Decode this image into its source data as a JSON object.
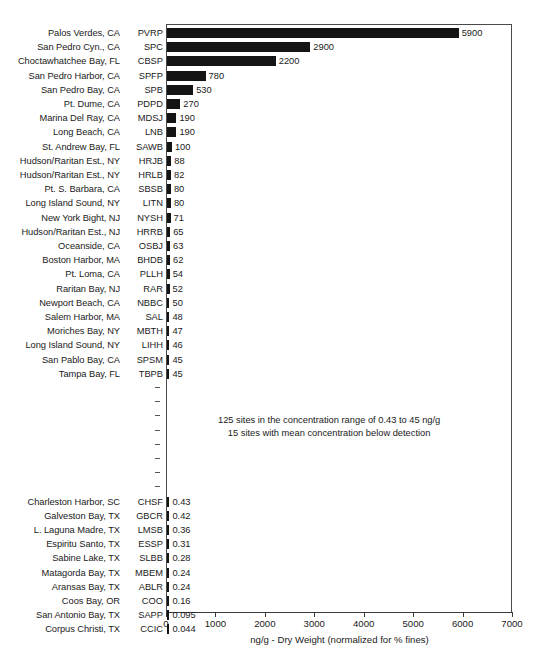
{
  "chart_data": {
    "type": "bar",
    "orientation": "horizontal",
    "title": "",
    "xlabel": "ng/g - Dry Weight (normalized for % fines)",
    "ylabel": "",
    "xlim": [
      0,
      7000
    ],
    "xticks": [
      0,
      1000,
      2000,
      3000,
      4000,
      5000,
      6000,
      7000
    ],
    "xtick_labels": [
      "0",
      "1000",
      "2000",
      "3000",
      "4000",
      "5000",
      "6000",
      "7000"
    ],
    "grid": false,
    "legend": null,
    "bar_color": "#141414",
    "axis_color": "#3a3a3a",
    "rows": [
      {
        "site": "Palos Verdes, CA",
        "code": "PVRP",
        "value": 5900,
        "label": "5900",
        "kind": "bar"
      },
      {
        "site": "San Pedro Cyn., CA",
        "code": "SPC",
        "value": 2900,
        "label": "2900",
        "kind": "bar"
      },
      {
        "site": "Choctawhatchee Bay, FL",
        "code": "CBSP",
        "value": 2200,
        "label": "2200",
        "kind": "bar"
      },
      {
        "site": "San Pedro Harbor, CA",
        "code": "SPFP",
        "value": 780,
        "label": "780",
        "kind": "bar"
      },
      {
        "site": "San Pedro Bay, CA",
        "code": "SPB",
        "value": 530,
        "label": "530",
        "kind": "bar"
      },
      {
        "site": "Pt. Dume, CA",
        "code": "PDPD",
        "value": 270,
        "label": "270",
        "kind": "bar"
      },
      {
        "site": "Marina Del Ray, CA",
        "code": "MDSJ",
        "value": 190,
        "label": "190",
        "kind": "bar"
      },
      {
        "site": "Long Beach, CA",
        "code": "LNB",
        "value": 190,
        "label": "190",
        "kind": "bar"
      },
      {
        "site": "St. Andrew Bay, FL",
        "code": "SAWB",
        "value": 100,
        "label": "100",
        "kind": "bar"
      },
      {
        "site": "Hudson/Raritan Est., NY",
        "code": "HRJB",
        "value": 88,
        "label": "88",
        "kind": "bar"
      },
      {
        "site": "Hudson/Raritan Est., NY",
        "code": "HRLB",
        "value": 82,
        "label": "82",
        "kind": "bar"
      },
      {
        "site": "Pt. S. Barbara, CA",
        "code": "SBSB",
        "value": 80,
        "label": "80",
        "kind": "bar"
      },
      {
        "site": "Long Island Sound, NY",
        "code": "LITN",
        "value": 80,
        "label": "80",
        "kind": "bar"
      },
      {
        "site": "New York Bight, NJ",
        "code": "NYSH",
        "value": 71,
        "label": "71",
        "kind": "bar"
      },
      {
        "site": "Hudson/Raritan Est., NJ",
        "code": "HRRB",
        "value": 65,
        "label": "65",
        "kind": "bar"
      },
      {
        "site": "Oceanside, CA",
        "code": "OSBJ",
        "value": 63,
        "label": "63",
        "kind": "bar"
      },
      {
        "site": "Boston Harbor, MA",
        "code": "BHDB",
        "value": 62,
        "label": "62",
        "kind": "bar"
      },
      {
        "site": "Pt. Loma, CA",
        "code": "PLLH",
        "value": 54,
        "label": "54",
        "kind": "bar"
      },
      {
        "site": "Raritan Bay, NJ",
        "code": "RAR",
        "value": 52,
        "label": "52",
        "kind": "bar"
      },
      {
        "site": "Newport Beach, CA",
        "code": "NBBC",
        "value": 50,
        "label": "50",
        "kind": "bar"
      },
      {
        "site": "Salem Harbor, MA",
        "code": "SAL",
        "value": 48,
        "label": "48",
        "kind": "bar"
      },
      {
        "site": "Moriches Bay, NY",
        "code": "MBTH",
        "value": 47,
        "label": "47",
        "kind": "bar"
      },
      {
        "site": "Long Island Sound, NY",
        "code": "LIHH",
        "value": 46,
        "label": "46",
        "kind": "bar"
      },
      {
        "site": "San Pablo Bay, CA",
        "code": "SPSM",
        "value": 45,
        "label": "45",
        "kind": "bar"
      },
      {
        "site": "Tampa Bay, FL",
        "code": "TBPB",
        "value": 45,
        "label": "45",
        "kind": "bar"
      },
      {
        "site": "",
        "code": "",
        "value": null,
        "label": "",
        "kind": "dash"
      },
      {
        "site": "",
        "code": "",
        "value": null,
        "label": "",
        "kind": "dash"
      },
      {
        "site": "",
        "code": "",
        "value": null,
        "label": "",
        "kind": "dash"
      },
      {
        "site": "",
        "code": "",
        "value": null,
        "label": "",
        "kind": "dash"
      },
      {
        "site": "",
        "code": "",
        "value": null,
        "label": "",
        "kind": "dash"
      },
      {
        "site": "",
        "code": "",
        "value": null,
        "label": "",
        "kind": "dash"
      },
      {
        "site": "",
        "code": "",
        "value": null,
        "label": "",
        "kind": "dash"
      },
      {
        "site": "",
        "code": "",
        "value": null,
        "label": "",
        "kind": "dash"
      },
      {
        "site": "Charleston Harbor, SC",
        "code": "CHSF",
        "value": 0.43,
        "label": "0.43",
        "kind": "bar"
      },
      {
        "site": "Galveston Bay, TX",
        "code": "GBCR",
        "value": 0.42,
        "label": "0.42",
        "kind": "bar"
      },
      {
        "site": "L. Laguna Madre, TX",
        "code": "LMSB",
        "value": 0.36,
        "label": "0.36",
        "kind": "bar"
      },
      {
        "site": "Espiritu Santo, TX",
        "code": "ESSP",
        "value": 0.31,
        "label": "0.31",
        "kind": "bar"
      },
      {
        "site": "Sabine Lake, TX",
        "code": "SLBB",
        "value": 0.28,
        "label": "0.28",
        "kind": "bar"
      },
      {
        "site": "Matagorda Bay, TX",
        "code": "MBEM",
        "value": 0.24,
        "label": "0.24",
        "kind": "bar"
      },
      {
        "site": "Aransas Bay, TX",
        "code": "ABLR",
        "value": 0.24,
        "label": "0.24",
        "kind": "bar"
      },
      {
        "site": "Coos Bay, OR",
        "code": "COO",
        "value": 0.16,
        "label": "0.16",
        "kind": "bar"
      },
      {
        "site": "San Antonio Bay, TX",
        "code": "SAPP",
        "value": 0.095,
        "label": "0.095",
        "kind": "bar"
      },
      {
        "site": "Corpus Christi, TX",
        "code": "CCIC",
        "value": 0.044,
        "label": "0.044",
        "kind": "bar"
      }
    ],
    "annotations": [
      "125 sites in the concentration range of 0.43 to 45 ng/g",
      "15 sites with mean concentration below detection"
    ]
  }
}
